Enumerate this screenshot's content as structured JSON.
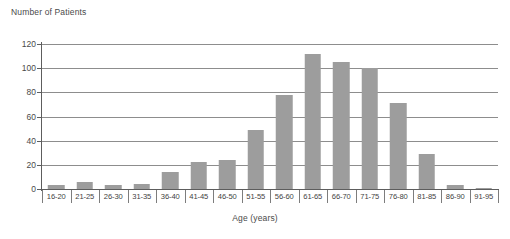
{
  "chart_data": {
    "type": "bar",
    "title": "",
    "xlabel": "Age (years)",
    "ylabel": "Number of Patients",
    "ylim": [
      0,
      120
    ],
    "yticks": [
      0,
      20,
      40,
      60,
      80,
      100,
      120
    ],
    "grid": true,
    "legend": null,
    "bar_color": "#9d9d9d",
    "categories": [
      "16-20",
      "21-25",
      "26-30",
      "31-35",
      "36-40",
      "41-45",
      "46-50",
      "51-55",
      "56-60",
      "61-65",
      "66-70",
      "71-75",
      "76-80",
      "81-85",
      "86-90",
      "91-95"
    ],
    "values": [
      3,
      6,
      3,
      4,
      14,
      22,
      24,
      49,
      78,
      112,
      105,
      100,
      71,
      29,
      3,
      1
    ]
  }
}
